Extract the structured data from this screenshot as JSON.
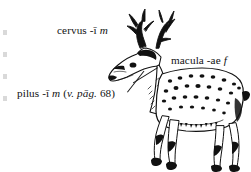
{
  "page": {
    "kind": "latin-textbook-vocabulary-illustration",
    "background_color": "#ffffff",
    "text_color": "#121212",
    "width": 251,
    "height": 172
  },
  "labels": [
    {
      "id": "cervus",
      "headword": "cervus",
      "ending": "-ī",
      "gender": "m",
      "full_text": "cervus -ī m",
      "points_to": "deer-antlers"
    },
    {
      "id": "macula",
      "headword": "macula",
      "ending": "-ae",
      "gender": "f",
      "full_text": "macula -ae f",
      "points_to": "deer-back-spot"
    },
    {
      "id": "pilus",
      "headword": "pilus",
      "ending": "-ī",
      "gender": "m",
      "cross_reference": "(v. pāg. 68)",
      "full_text": "pilus -ī m (v. pāg. 68)",
      "points_to": "deer-neck-hair"
    }
  ],
  "label_parts": {
    "cervus": {
      "roman": "cervus -ī ",
      "italic": "m"
    },
    "macula": {
      "roman": "macula -ae ",
      "italic": "f"
    },
    "pilus": {
      "roman": "pilus -ī ",
      "italic_gender": "m",
      "paren_open": " (",
      "italic_ref": "v. pāg.",
      "page_number": " 68)"
    }
  },
  "figure": {
    "subject": "cervus",
    "ink_color": "#111111"
  }
}
